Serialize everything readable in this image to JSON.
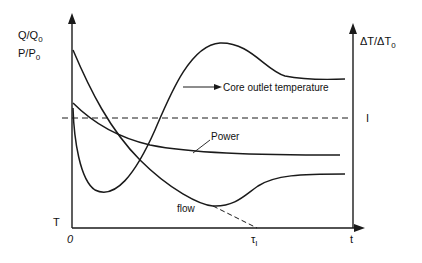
{
  "figure": {
    "left_axis_label_line1": "Q/Q",
    "left_axis_label_line1_sub": "0",
    "left_axis_label_line2": "P/P",
    "left_axis_label_line2_sub": "0",
    "right_axis_label": "ΔT/ΔT",
    "right_axis_label_sub": "0",
    "right_axis_tick": "I",
    "origin_label": "0",
    "t_label": "T",
    "x_axis_label": "t",
    "tau_label": "τ",
    "tau_sub": "I",
    "curves": {
      "core_outlet": "Core outlet temperature",
      "power": "Power",
      "flow": "flow"
    }
  },
  "colors": {
    "line": "#1a1a1a",
    "background": "#ffffff"
  }
}
